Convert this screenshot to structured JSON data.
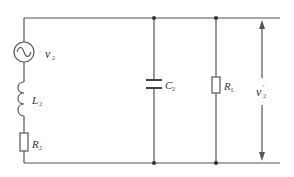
{
  "diagram": {
    "type": "circuit-schematic",
    "components": [
      {
        "id": "source",
        "symbol": "ac-voltage-source",
        "label": "v",
        "subscript": "2"
      },
      {
        "id": "inductor",
        "symbol": "inductor",
        "label": "L",
        "subscript": "2"
      },
      {
        "id": "series-resistor",
        "symbol": "resistor",
        "label": "R",
        "subscript": "2"
      },
      {
        "id": "capacitor",
        "symbol": "capacitor",
        "label": "C",
        "subscript": "2"
      },
      {
        "id": "load-resistor",
        "symbol": "resistor",
        "label": "R",
        "subscript": "L"
      },
      {
        "id": "output-voltage",
        "symbol": "voltage-arrow",
        "label": "v",
        "subscript": "2",
        "superscript": "'"
      }
    ],
    "labels": {
      "source_main": "v",
      "source_sub": "2",
      "inductor_main": "L",
      "inductor_sub": "2",
      "resistor_series_main": "R",
      "resistor_series_sub": "2",
      "capacitor_main": "C",
      "capacitor_sub": "2",
      "load_main": "R",
      "load_sub": "L",
      "output_main": "v",
      "output_sub": "2",
      "output_sup": "'"
    },
    "colors": {
      "wire": "#555555",
      "text": "#333333",
      "background": "#ffffff"
    }
  }
}
